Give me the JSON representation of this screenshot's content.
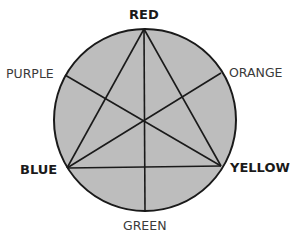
{
  "diagram": {
    "type": "color-wheel",
    "fill_color": "#bdbdbd",
    "stroke_color": "#1a1a1a",
    "circle": {
      "cx": 145,
      "cy": 120,
      "r": 91
    },
    "vertices": {
      "red": {
        "x": 144,
        "y": 29
      },
      "blue": {
        "x": 67,
        "y": 168
      },
      "yellow": {
        "x": 221,
        "y": 166
      },
      "purple": {
        "x": 65,
        "y": 75
      },
      "orange": {
        "x": 221,
        "y": 73
      },
      "green": {
        "x": 145,
        "y": 212
      }
    },
    "labels": {
      "red": "RED",
      "orange": "ORANGE",
      "yellow": "YELLOW",
      "green": "GREEN",
      "blue": "BLUE",
      "purple": "PURPLE"
    },
    "primary": [
      "RED",
      "YELLOW",
      "BLUE"
    ],
    "secondary": [
      "ORANGE",
      "GREEN",
      "PURPLE"
    ]
  }
}
